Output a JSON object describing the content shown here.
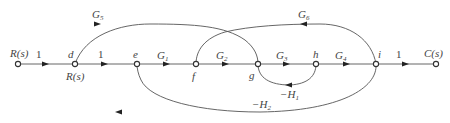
{
  "diagram": {
    "type": "signal-flow-graph",
    "nodes": [
      {
        "id": "R_in",
        "label": "R(s)",
        "x": 18,
        "y": 64
      },
      {
        "id": "d",
        "label": "d",
        "sublabel": "R(s)",
        "x": 75,
        "y": 64
      },
      {
        "id": "e",
        "label": "e",
        "x": 137,
        "y": 64
      },
      {
        "id": "f",
        "label": "f",
        "x": 196,
        "y": 64
      },
      {
        "id": "g",
        "label": "g",
        "x": 258,
        "y": 64
      },
      {
        "id": "h",
        "label": "h",
        "x": 316,
        "y": 64
      },
      {
        "id": "i",
        "label": "i",
        "x": 376,
        "y": 64
      },
      {
        "id": "C_out",
        "label": "C(s)",
        "x": 436,
        "y": 64
      }
    ],
    "branches": [
      {
        "from": "R_in",
        "to": "d",
        "gain": "1"
      },
      {
        "from": "d",
        "to": "e",
        "gain": "1"
      },
      {
        "from": "e",
        "to": "f",
        "gain_main": "G",
        "gain_sub": "1"
      },
      {
        "from": "f",
        "to": "g",
        "gain_main": "G",
        "gain_sub": "2"
      },
      {
        "from": "g",
        "to": "h",
        "gain_main": "G",
        "gain_sub": "3"
      },
      {
        "from": "h",
        "to": "i",
        "gain_main": "G",
        "gain_sub": "4"
      },
      {
        "from": "i",
        "to": "C_out",
        "gain": "1"
      },
      {
        "from": "d",
        "to": "g",
        "gain_main": "G",
        "gain_sub": "5",
        "style": "arc-over"
      },
      {
        "from": "i",
        "to": "f",
        "gain_main": "G",
        "gain_sub": "6",
        "style": "arc-over"
      },
      {
        "from": "h",
        "to": "g",
        "gain_main": "-H",
        "gain_sub": "1",
        "style": "arc-under"
      },
      {
        "from": "i",
        "to": "e",
        "gain_main": "-H",
        "gain_sub": "2",
        "style": "arc-under"
      }
    ]
  },
  "labels": {
    "input": "R(s)",
    "output": "C(s)",
    "d": "d",
    "d_sub": "R(s)",
    "e": "e",
    "f": "f",
    "g": "g",
    "h": "h",
    "i": "i",
    "one": "1",
    "G": "G",
    "H": "−H",
    "s1": "1",
    "s2": "2",
    "s3": "3",
    "s4": "4",
    "s5": "5",
    "s6": "6"
  }
}
